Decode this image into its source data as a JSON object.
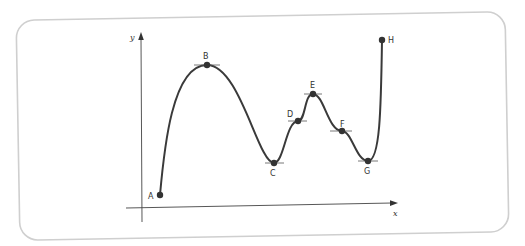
{
  "diagram": {
    "title": "",
    "colors": {
      "frame": "#cfcfcf",
      "axis": "#444444",
      "curve": "#3a3a3a",
      "point": "#333333",
      "tangent": "#555555",
      "label": "#333333"
    },
    "axes": {
      "x_label": "x",
      "y_label": "y"
    },
    "points": [
      {
        "id": "A",
        "label": "A",
        "kind": "endpoint",
        "tangent": false
      },
      {
        "id": "B",
        "label": "B",
        "kind": "local maximum",
        "tangent": true
      },
      {
        "id": "C",
        "label": "C",
        "kind": "local minimum",
        "tangent": true
      },
      {
        "id": "D",
        "label": "D",
        "kind": "stationary inflection",
        "tangent": true
      },
      {
        "id": "E",
        "label": "E",
        "kind": "local maximum",
        "tangent": true
      },
      {
        "id": "F",
        "label": "F",
        "kind": "stationary inflection",
        "tangent": true
      },
      {
        "id": "G",
        "label": "G",
        "kind": "local minimum",
        "tangent": true
      },
      {
        "id": "H",
        "label": "H",
        "kind": "endpoint",
        "tangent": false
      }
    ]
  }
}
